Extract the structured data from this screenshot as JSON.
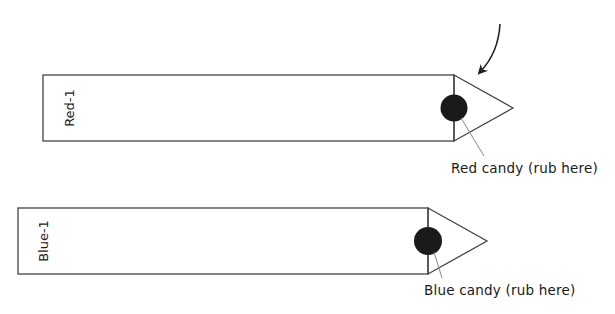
{
  "strips": [
    {
      "label": "Red-1",
      "candy_label": "Red candy (rub here)",
      "candy_color": "#1a1a1a"
    },
    {
      "label": "Blue-1",
      "candy_label": "Blue candy (rub here)",
      "candy_color": "#1a1a1a"
    }
  ],
  "colors": {
    "stroke": "#444444",
    "leader": "#888888",
    "text": "#1a1a1a"
  }
}
